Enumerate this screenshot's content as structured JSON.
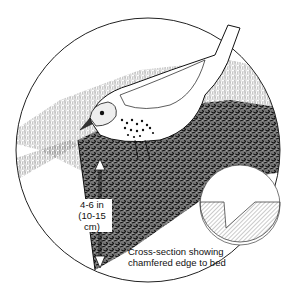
{
  "figure": {
    "depth_label_line1": "4-6 in",
    "depth_label_line2": "(10-15 cm)",
    "caption_line1": "Cross-section showing",
    "caption_line2": "chamfered edge to bed"
  },
  "colors": {
    "ink": "#111111",
    "background": "#ffffff",
    "hatch": "#555555"
  }
}
